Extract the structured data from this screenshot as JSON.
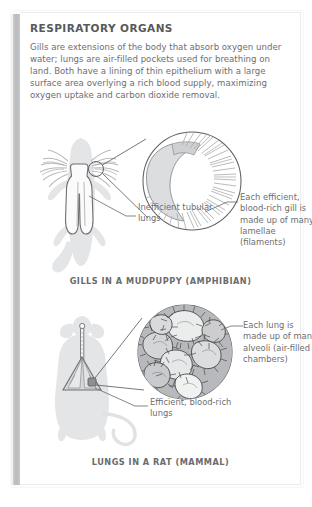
{
  "page": {
    "title": "RESPIRATORY ORGANS",
    "body": "Gills are extensions of the body that absorb oxygen under water; lungs are air-filled pockets used for breathing on land. Both have a lining of thin epithelium with a large surface area overlying a rich blood supply, maximizing oxygen uptake and carbon dioxide removal.",
    "colors": {
      "title_text": "#58595b",
      "body_text": "#6d6e71",
      "caption_text": "#6a6b6d",
      "silhouette_fill": "#e3e4e6",
      "organ_outline": "#6f7072",
      "leader_line": "#6f7072",
      "binding_gray": "#b9babd",
      "page_white": "#ffffff"
    }
  },
  "figures": [
    {
      "id": "gills",
      "caption": "GILLS IN A MUDPUPPY (AMPHIBIAN)",
      "subject": "mudpuppy-salamander-silhouette",
      "magnifier": "gill-filament-detail-circle",
      "labels": [
        {
          "id": "inefficient",
          "text": "Inefficient tubular lungs"
        },
        {
          "id": "lamellae",
          "text": "Each efficient, blood-rich gill is made up of many lamellae (filaments)"
        }
      ]
    },
    {
      "id": "lungs",
      "caption": "LUNGS IN A RAT (MAMMAL)",
      "subject": "rat-silhouette",
      "magnifier": "alveoli-detail-circle",
      "labels": [
        {
          "id": "alveoli",
          "text": "Each lung is made up of many alveoli (air-filled chambers)"
        },
        {
          "id": "efficient",
          "text": "Efficient, blood-rich lungs"
        }
      ]
    }
  ]
}
